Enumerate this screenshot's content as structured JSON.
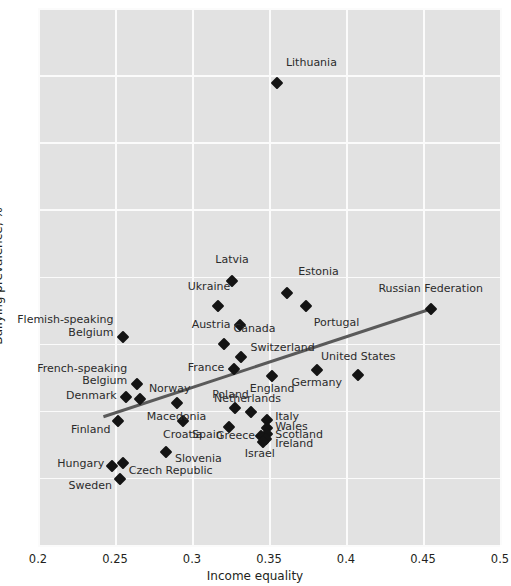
{
  "chart_data": {
    "type": "scatter",
    "title": "",
    "xlabel": "Income equality",
    "ylabel": "Bullying prevalence, %",
    "xlim": [
      0.2,
      0.5
    ],
    "ylim": [
      0,
      40
    ],
    "xticks": [
      "0.2",
      "0.25",
      "0.3",
      "0.35",
      "0.4",
      "0.45",
      "0.5"
    ],
    "xtick_values": [
      0.2,
      0.25,
      0.3,
      0.35,
      0.4,
      0.45,
      0.5
    ],
    "yticks": [
      "0",
      "5",
      "10",
      "15",
      "20",
      "25",
      "30",
      "35",
      "40"
    ],
    "ytick_values": [
      0,
      5,
      10,
      15,
      20,
      25,
      30,
      35,
      40
    ],
    "grid": true,
    "grid_color": "#fbfbfb",
    "plot_background": "#e2e2e2",
    "marker_color": "#141414",
    "marker_shape": "diamond",
    "legend": "none",
    "points": [
      {
        "name": "Lithuania",
        "x": 0.355,
        "y": 34.4,
        "lx": 0.361,
        "ly": 35.9,
        "anchor": "l"
      },
      {
        "name": "Latvia",
        "x": 0.326,
        "y": 19.7,
        "lx": 0.326,
        "ly": 21.2,
        "anchor": "c"
      },
      {
        "name": "Estonia",
        "x": 0.362,
        "y": 18.8,
        "lx": 0.369,
        "ly": 20.3,
        "anchor": "l"
      },
      {
        "name": "Portugal",
        "x": 0.374,
        "y": 17.8,
        "lx": 0.379,
        "ly": 16.5,
        "anchor": "l"
      },
      {
        "name": "Russian Federation",
        "x": 0.455,
        "y": 17.6,
        "lx": 0.455,
        "ly": 19.1,
        "anchor": "c"
      },
      {
        "name": "Ukraine",
        "x": 0.317,
        "y": 17.8,
        "lx": 0.311,
        "ly": 19.2,
        "anchor": "c"
      },
      {
        "name": "Austria",
        "x": 0.331,
        "y": 16.4,
        "lx": 0.325,
        "ly": 16.4,
        "anchor": "r"
      },
      {
        "name": "Flemish-speaking\nBelgium",
        "x": 0.255,
        "y": 15.5,
        "lx": 0.249,
        "ly": 16.3,
        "anchor": "r"
      },
      {
        "name": "Canada",
        "x": 0.321,
        "y": 15.0,
        "lx": 0.327,
        "ly": 16.1,
        "anchor": "l"
      },
      {
        "name": "Switzerland",
        "x": 0.332,
        "y": 14.0,
        "lx": 0.338,
        "ly": 14.7,
        "anchor": "l"
      },
      {
        "name": "France",
        "x": 0.327,
        "y": 13.1,
        "lx": 0.321,
        "ly": 13.2,
        "anchor": "r"
      },
      {
        "name": "United States",
        "x": 0.408,
        "y": 12.7,
        "lx": 0.408,
        "ly": 14.0,
        "anchor": "c"
      },
      {
        "name": "Germany",
        "x": 0.381,
        "y": 13.0,
        "lx": 0.381,
        "ly": 12.1,
        "anchor": "c"
      },
      {
        "name": "England",
        "x": 0.352,
        "y": 12.6,
        "lx": 0.352,
        "ly": 11.6,
        "anchor": "c"
      },
      {
        "name": "French-speaking\nBelgium",
        "x": 0.264,
        "y": 12.0,
        "lx": 0.258,
        "ly": 12.7,
        "anchor": "r"
      },
      {
        "name": "Denmark",
        "x": 0.257,
        "y": 11.0,
        "lx": 0.251,
        "ly": 11.1,
        "anchor": "r"
      },
      {
        "name": "Norway",
        "x": 0.266,
        "y": 10.9,
        "lx": 0.272,
        "ly": 11.6,
        "anchor": "l"
      },
      {
        "name": "Poland",
        "x": 0.328,
        "y": 10.2,
        "lx": 0.325,
        "ly": 11.2,
        "anchor": "c"
      },
      {
        "name": "Macedonia",
        "x": 0.29,
        "y": 10.6,
        "lx": 0.29,
        "ly": 9.5,
        "anchor": "c"
      },
      {
        "name": "Netherlands",
        "x": 0.338,
        "y": 9.9,
        "lx": 0.336,
        "ly": 10.9,
        "anchor": "c"
      },
      {
        "name": "Italy",
        "x": 0.349,
        "y": 9.3,
        "lx": 0.354,
        "ly": 9.5,
        "anchor": "l"
      },
      {
        "name": "Finland",
        "x": 0.252,
        "y": 9.2,
        "lx": 0.247,
        "ly": 8.6,
        "anchor": "r"
      },
      {
        "name": "Croatia",
        "x": 0.294,
        "y": 9.2,
        "lx": 0.294,
        "ly": 8.2,
        "anchor": "c"
      },
      {
        "name": "Wales",
        "x": 0.349,
        "y": 8.7,
        "lx": 0.354,
        "ly": 8.8,
        "anchor": "l"
      },
      {
        "name": "Spain",
        "x": 0.324,
        "y": 8.8,
        "lx": 0.32,
        "ly": 8.2,
        "anchor": "r"
      },
      {
        "name": "Scotland",
        "x": 0.349,
        "y": 8.3,
        "lx": 0.354,
        "ly": 8.2,
        "anchor": "l"
      },
      {
        "name": "Greece",
        "x": 0.345,
        "y": 8.1,
        "lx": 0.341,
        "ly": 8.1,
        "anchor": "r"
      },
      {
        "name": "Ireland",
        "x": 0.348,
        "y": 7.9,
        "lx": 0.354,
        "ly": 7.5,
        "anchor": "l"
      },
      {
        "name": "Israel",
        "x": 0.346,
        "y": 7.7,
        "lx": 0.344,
        "ly": 6.8,
        "anchor": "c"
      },
      {
        "name": "Slovenia",
        "x": 0.283,
        "y": 6.9,
        "lx": 0.289,
        "ly": 6.4,
        "anchor": "l"
      },
      {
        "name": "Czech Republic",
        "x": 0.255,
        "y": 6.1,
        "lx": 0.259,
        "ly": 5.5,
        "anchor": "l"
      },
      {
        "name": "Hungary",
        "x": 0.248,
        "y": 5.9,
        "lx": 0.243,
        "ly": 6.0,
        "anchor": "r"
      },
      {
        "name": "Sweden",
        "x": 0.253,
        "y": 4.9,
        "lx": 0.248,
        "ly": 4.4,
        "anchor": "r"
      }
    ],
    "trendline": {
      "x1": 0.2425,
      "y1": 9.55,
      "x2": 0.4555,
      "y2": 17.6,
      "color": "#5a5a5a",
      "width": 3
    }
  }
}
